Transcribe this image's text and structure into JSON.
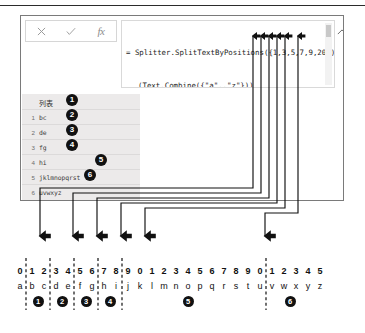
{
  "panel": {
    "formula_bar": {
      "cancel_label": "✕",
      "accept_label": "✓",
      "fx_label": "fx",
      "formula_line1": "= Splitter.SplitTextByPositions({1,3,5,7,9,20})",
      "formula_line2": "(Text.Combine({\"a\"..\"z\"}))",
      "formula_full": "= Splitter.SplitTextByPositions({1,3,5,7,9,20})(Text.Combine({\"a\"..\"z\"}))",
      "collapse_icon": "chevron-up-icon"
    },
    "result_table": {
      "column_header": "列表",
      "rows": [
        {
          "index": "1",
          "value": "bc",
          "callout": "1"
        },
        {
          "index": "2",
          "value": "de",
          "callout": "2"
        },
        {
          "index": "3",
          "value": "fg",
          "callout": "3"
        },
        {
          "index": "4",
          "value": "hi",
          "callout": "4"
        },
        {
          "index": "5",
          "value": "jklmnopqrst",
          "callout": "5"
        },
        {
          "index": "6",
          "value": "uvwxyz",
          "callout": "6"
        }
      ]
    }
  },
  "annotation": {
    "split_positions": [
      1,
      3,
      5,
      7,
      9,
      20
    ],
    "callout_numbers": [
      "1",
      "2",
      "3",
      "4",
      "5",
      "6"
    ],
    "down_arrow_glyph": "⬇",
    "up_arrow_glyph": "⬆"
  },
  "ruler": {
    "digits": [
      "0",
      "1",
      "2",
      "3",
      "4",
      "5",
      "6",
      "7",
      "8",
      "9",
      "0",
      "1",
      "2",
      "3",
      "4",
      "5",
      "6",
      "7",
      "8",
      "9",
      "0",
      "1",
      "2",
      "3",
      "4",
      "5"
    ],
    "letters": [
      "a",
      "b",
      "c",
      "d",
      "e",
      "f",
      "g",
      "h",
      "i",
      "j",
      "k",
      "l",
      "m",
      "n",
      "o",
      "p",
      "q",
      "r",
      "s",
      "t",
      "u",
      "v",
      "w",
      "x",
      "y",
      "z"
    ],
    "segment_bullets": [
      {
        "label": "1",
        "slot": 1.5
      },
      {
        "label": "2",
        "slot": 3.5
      },
      {
        "label": "3",
        "slot": 5.5
      },
      {
        "label": "4",
        "slot": 7.5
      },
      {
        "label": "5",
        "slot": 14.0
      },
      {
        "label": "6",
        "slot": 22.5
      }
    ],
    "divider_slots": [
      1,
      3,
      5,
      7,
      9,
      20
    ]
  },
  "colors": {
    "ink": "#111111",
    "panel_border": "#7a7a7a",
    "table_bg": "#eceaea",
    "formula_text": "#1d1d1d",
    "muted": "#9a9a9a"
  }
}
